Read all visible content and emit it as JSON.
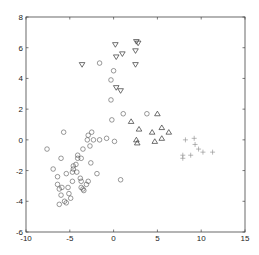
{
  "chart_data": {
    "type": "scatter",
    "title": "",
    "xlabel": "",
    "ylabel": "",
    "xlim": [
      -10,
      15
    ],
    "ylim": [
      -6,
      8
    ],
    "xticks": [
      -10,
      -5,
      0,
      5,
      10,
      15
    ],
    "yticks": [
      -6,
      -4,
      -2,
      0,
      2,
      4,
      6,
      8
    ],
    "grid": false,
    "legend": null,
    "series": [
      {
        "name": "circles",
        "marker": "circle",
        "color": "#555555",
        "points": [
          [
            -7.6,
            -0.6
          ],
          [
            -6.0,
            -1.2
          ],
          [
            -6.9,
            -1.9
          ],
          [
            -6.4,
            -2.4
          ],
          [
            -6.4,
            -2.9
          ],
          [
            -6.2,
            -3.2
          ],
          [
            -6.0,
            -3.6
          ],
          [
            -5.6,
            -4.0
          ],
          [
            -5.4,
            -4.1
          ],
          [
            -6.2,
            -4.2
          ],
          [
            -4.9,
            -3.8
          ],
          [
            -4.7,
            -2.7
          ],
          [
            -4.7,
            -2.1
          ],
          [
            -4.6,
            -1.9
          ],
          [
            -4.6,
            -1.7
          ],
          [
            -4.3,
            -1.6
          ],
          [
            -4.1,
            -1.2
          ],
          [
            -4.1,
            -1.0
          ],
          [
            -3.5,
            -0.6
          ],
          [
            -3.0,
            0.0
          ],
          [
            -2.9,
            0.3
          ],
          [
            -2.5,
            0.5
          ],
          [
            -2.3,
            0.0
          ],
          [
            -2.7,
            -0.4
          ],
          [
            -2.6,
            -1.5
          ],
          [
            -1.9,
            -2.2
          ],
          [
            -3.7,
            -1.2
          ],
          [
            -4.2,
            -2.1
          ],
          [
            -3.7,
            -2.7
          ],
          [
            -3.5,
            -3.2
          ],
          [
            -3.4,
            -3.3
          ],
          [
            -3.7,
            -3.1
          ],
          [
            -3.1,
            -2.9
          ],
          [
            -2.9,
            -2.7
          ],
          [
            -3.8,
            -2.5
          ],
          [
            -5.4,
            -2.2
          ],
          [
            -5.9,
            -3.1
          ],
          [
            -5.2,
            -3.1
          ],
          [
            -5.1,
            -3.5
          ],
          [
            -5.7,
            0.5
          ],
          [
            -1.6,
            0.0
          ],
          [
            -0.8,
            0.1
          ],
          [
            0.8,
            -2.6
          ],
          [
            0.1,
            -0.1
          ],
          [
            -0.2,
            1.3
          ],
          [
            -0.3,
            2.6
          ],
          [
            -0.3,
            3.9
          ],
          [
            -1.6,
            5.0
          ],
          [
            0.0,
            4.5
          ],
          [
            1.1,
            1.7
          ],
          [
            3.8,
            1.7
          ]
        ]
      },
      {
        "name": "downward triangles",
        "marker": "triangle-down",
        "color": "#333333",
        "points": [
          [
            0.2,
            6.2
          ],
          [
            2.6,
            6.4
          ],
          [
            2.8,
            6.3
          ],
          [
            0.3,
            5.4
          ],
          [
            1.0,
            5.6
          ],
          [
            2.5,
            5.8
          ],
          [
            2.5,
            4.9
          ],
          [
            -3.6,
            4.9
          ],
          [
            0.3,
            3.4
          ],
          [
            0.8,
            3.2
          ]
        ]
      },
      {
        "name": "upward triangles",
        "marker": "triangle-up",
        "color": "#333333",
        "points": [
          [
            5.0,
            1.7
          ],
          [
            2.0,
            1.2
          ],
          [
            2.9,
            0.7
          ],
          [
            5.5,
            0.8
          ],
          [
            6.3,
            0.5
          ],
          [
            2.6,
            0.0
          ],
          [
            2.7,
            -0.2
          ],
          [
            4.7,
            -0.1
          ],
          [
            5.5,
            0.1
          ],
          [
            4.4,
            0.5
          ]
        ]
      },
      {
        "name": "plus markers",
        "marker": "plus",
        "color": "#888888",
        "points": [
          [
            8.2,
            0.0
          ],
          [
            9.2,
            0.1
          ],
          [
            9.3,
            -0.3
          ],
          [
            9.7,
            -0.6
          ],
          [
            10.2,
            -0.8
          ],
          [
            11.3,
            -0.8
          ],
          [
            7.9,
            -1.0
          ],
          [
            8.8,
            -1.0
          ],
          [
            7.9,
            -1.2
          ]
        ]
      }
    ]
  }
}
